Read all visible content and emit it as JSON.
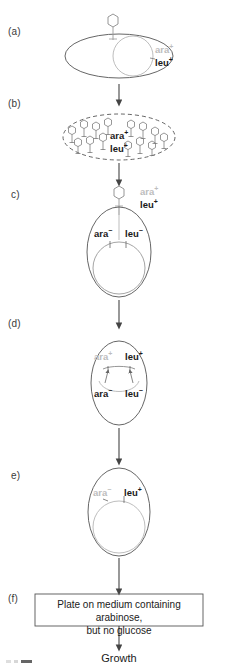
{
  "figure": {
    "type": "diagram",
    "panels": [
      {
        "id": "a",
        "letter": "(a)",
        "shape": "donor-cell-ellipse-with-phage",
        "labels": [
          {
            "gene": "ara",
            "sign": "+",
            "tone": "gray"
          },
          {
            "gene": "leu",
            "sign": "+",
            "tone": "dark"
          }
        ]
      },
      {
        "id": "b",
        "letter": "(b)",
        "shape": "dashed-lysed-cell-with-many-phage",
        "labels": [
          {
            "gene": "ara",
            "sign": "+",
            "tone": "dark"
          },
          {
            "gene": "leu",
            "sign": "+",
            "tone": "dark"
          }
        ]
      },
      {
        "id": "c",
        "letter": "c)",
        "shape": "recipient-cell-phage-injecting",
        "labels": [
          {
            "gene": "ara",
            "sign": "+",
            "tone": "gray"
          },
          {
            "gene": "leu",
            "sign": "+",
            "tone": "dark"
          },
          {
            "gene": "ara",
            "sign": "-",
            "tone": "dark"
          },
          {
            "gene": "leu",
            "sign": "-",
            "tone": "dark"
          }
        ]
      },
      {
        "id": "d",
        "letter": "(d)",
        "shape": "recombination-crossover",
        "labels": [
          {
            "gene": "ara",
            "sign": "+",
            "tone": "gray"
          },
          {
            "gene": "leu",
            "sign": "+",
            "tone": "dark"
          },
          {
            "gene": "ara",
            "sign": "-",
            "tone": "dark"
          },
          {
            "gene": "leu",
            "sign": "-",
            "tone": "dark"
          }
        ]
      },
      {
        "id": "e",
        "letter": "e)",
        "shape": "recombinant-cell",
        "labels": [
          {
            "gene": "ara",
            "sign": "-",
            "tone": "gray"
          },
          {
            "gene": "leu",
            "sign": "+",
            "tone": "dark"
          }
        ]
      },
      {
        "id": "f",
        "letter": "(f)",
        "shape": "plating-box",
        "box_text": "Plate on medium containing arabinose,\nbut  no glucose"
      }
    ],
    "outcome_label": "Growth",
    "gene_text": {
      "ara_plus": "ara",
      "ara_minus": "ara",
      "leu_plus": "leu",
      "leu_minus": "leu",
      "plus": "+",
      "minus": "−"
    },
    "letters": {
      "a": "(a)",
      "b": "(b)",
      "c": "c)",
      "d": "(d)",
      "e": "e)",
      "f": "(f)"
    },
    "colors": {
      "stroke": "#555555",
      "stroke_light": "#b5b5b5",
      "text_dark": "#1a1a1a",
      "text_gray": "#bdbdbd",
      "background": "#ffffff"
    }
  }
}
